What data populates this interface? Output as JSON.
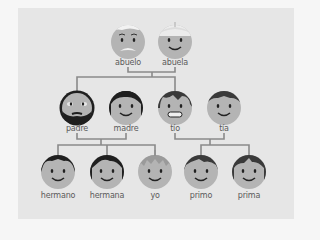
{
  "diagram": {
    "type": "family-tree",
    "language": "Spanish",
    "colors": {
      "page_background": "#f6f6f6",
      "panel_background": "#e6e6e6",
      "connector": "#8a8a8a",
      "face": "#b4b4b4",
      "hair_dark": "#2a2a2a",
      "label": "#5a5a5a"
    },
    "generations": [
      {
        "level": 1,
        "members": [
          {
            "id": "abuelo",
            "label": "abuelo",
            "hair": "white",
            "feature": "mustache"
          },
          {
            "id": "abuela",
            "label": "abuela",
            "hair": "white",
            "feature": "smile"
          }
        ]
      },
      {
        "level": 2,
        "members": [
          {
            "id": "padre",
            "label": "padre",
            "hair": "black",
            "feature": "beard"
          },
          {
            "id": "madre",
            "label": "madre",
            "hair": "black",
            "feature": "smile"
          },
          {
            "id": "tio",
            "label": "tío",
            "hair": "dark-gray",
            "feature": "toothy-grin"
          },
          {
            "id": "tia",
            "label": "tía",
            "hair": "dark-gray",
            "feature": "smile"
          }
        ]
      },
      {
        "level": 3,
        "members": [
          {
            "id": "hermano",
            "label": "hermano",
            "hair": "black",
            "feature": "smile"
          },
          {
            "id": "hermana",
            "label": "hermana",
            "hair": "black",
            "feature": "smile"
          },
          {
            "id": "yo",
            "label": "yo",
            "hair": "light-gray",
            "feature": "smile"
          },
          {
            "id": "primo",
            "label": "primo",
            "hair": "dark-gray",
            "feature": "smile"
          },
          {
            "id": "prima",
            "label": "prima",
            "hair": "dark-gray",
            "feature": "smile"
          }
        ]
      }
    ],
    "relations": [
      {
        "couple": [
          "abuelo",
          "abuela"
        ],
        "children": [
          "padre",
          "tio"
        ]
      },
      {
        "couple": [
          "padre",
          "madre"
        ],
        "children": [
          "hermano",
          "hermana",
          "yo"
        ]
      },
      {
        "couple": [
          "tio",
          "tia"
        ],
        "children": [
          "primo",
          "prima"
        ]
      }
    ]
  }
}
